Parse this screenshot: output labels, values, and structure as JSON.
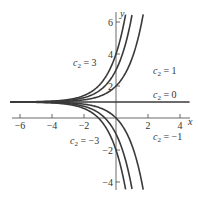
{
  "chart_data": {
    "type": "line",
    "title": "",
    "xlabel": "x",
    "ylabel": "y",
    "xlim": [
      -6.6,
      4.6
    ],
    "ylim": [
      -4.6,
      6.8
    ],
    "x_ticks": [
      -6,
      -4,
      -2,
      2,
      4
    ],
    "y_ticks": [
      -4,
      -2,
      2,
      4,
      6
    ],
    "x_tick_labels": [
      "−6",
      "−4",
      "−2",
      "2",
      "4"
    ],
    "y_tick_labels": [
      "−4",
      "−2",
      "2",
      "4",
      "6"
    ],
    "formula": "y = 1 + c2·e^x",
    "series": [
      {
        "name": "c2 = 3",
        "c2": 3
      },
      {
        "name": "c2 = 2",
        "c2": 2
      },
      {
        "name": "c2 = 1",
        "c2": 1
      },
      {
        "name": "c2 = 0",
        "c2": 0
      },
      {
        "name": "c2 = -1",
        "c2": -1
      },
      {
        "name": "c2 = -2",
        "c2": -2
      },
      {
        "name": "c2 = -3",
        "c2": -3
      }
    ],
    "annotations": [
      {
        "text": "c₂ = 3",
        "x": 73,
        "y": 66
      },
      {
        "text": "c₂ = 1",
        "x": 153,
        "y": 74
      },
      {
        "text": "c₂ = 0",
        "x": 153,
        "y": 98
      },
      {
        "text": "c₂ = −1",
        "x": 153,
        "y": 140
      },
      {
        "text": "c₂ = −3",
        "x": 70,
        "y": 144
      }
    ],
    "grid": false,
    "legend": "none",
    "line_color": "#3a3a3a"
  }
}
